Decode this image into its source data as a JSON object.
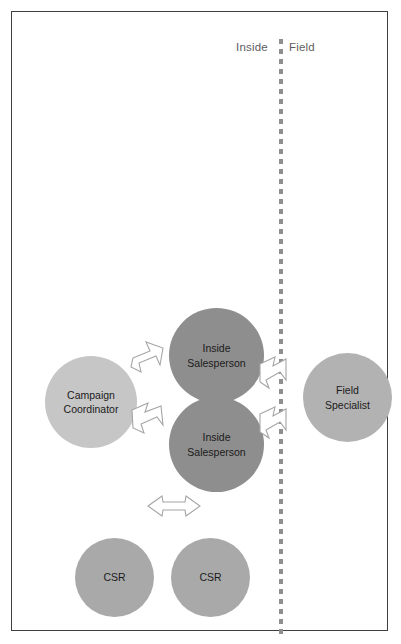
{
  "diagram": {
    "zones": {
      "left_label": "Inside",
      "right_label": "Field",
      "divider_name": "inside-field-divider"
    },
    "nodes": [
      {
        "id": "campaign-coordinator",
        "label": "Campaign\nCoordinator",
        "color": "#c6c6c6",
        "zone": "Inside"
      },
      {
        "id": "inside-salesperson-1",
        "label": "Inside\nSalesperson",
        "color": "#8e8e8e",
        "zone": "Inside"
      },
      {
        "id": "inside-salesperson-2",
        "label": "Inside\nSalesperson",
        "color": "#8e8e8e",
        "zone": "Inside"
      },
      {
        "id": "field-specialist",
        "label": "Field\nSpecialist",
        "color": "#b2b2b2",
        "zone": "Field"
      },
      {
        "id": "csr-1",
        "label": "CSR",
        "color": "#a9a9a9",
        "zone": "Inside"
      },
      {
        "id": "csr-2",
        "label": "CSR",
        "color": "#a9a9a9",
        "zone": "Inside"
      }
    ],
    "connectors": [
      {
        "id": "coord-to-is1",
        "icon": "block-arrow-northeast-icon",
        "from": "campaign-coordinator",
        "to": "inside-salesperson-1",
        "direction": "northeast"
      },
      {
        "id": "coord-to-is2",
        "icon": "block-arrow-southeast-icon",
        "from": "campaign-coordinator",
        "to": "inside-salesperson-2",
        "direction": "southeast"
      },
      {
        "id": "is1-to-field",
        "icon": "block-arrow-southeast-icon",
        "from": "inside-salesperson-1",
        "to": "field-specialist",
        "direction": "southeast"
      },
      {
        "id": "is2-to-field",
        "icon": "block-arrow-southeast-icon",
        "from": "inside-salesperson-2",
        "to": "field-specialist",
        "direction": "southeast"
      },
      {
        "id": "csr-bidirectional",
        "icon": "block-arrow-double-horizontal-icon",
        "from": "csr-1",
        "to": "csr-2",
        "direction": "bidirectional"
      }
    ],
    "style": {
      "border_color": "#3f3f3f",
      "divider_color": "#8f8f8f",
      "connector_stroke": "#a5a5a5",
      "connector_fill": "#ffffff",
      "zone_label_color": "#5d5d5d",
      "node_text_color": "#1b1b1b",
      "background": "#ffffff"
    }
  }
}
